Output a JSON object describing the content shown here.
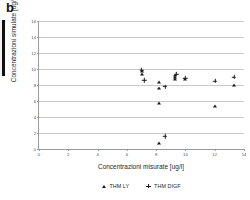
{
  "panel": {
    "label": "b"
  },
  "chart_data": {
    "type": "scatter",
    "title": "",
    "xlabel": "Concentrazioni misurate [ug/l]",
    "ylabel": "Concentrazioni simulate [ug/l]",
    "xlim": [
      0,
      14
    ],
    "ylim": [
      0,
      16
    ],
    "xticks": [
      0,
      2,
      4,
      6,
      8,
      10,
      12,
      14
    ],
    "yticks": [
      0,
      2,
      4,
      6,
      8,
      10,
      12,
      14,
      16
    ],
    "xtick_labels": [
      "0",
      "2",
      "4",
      "6",
      "8",
      "10",
      "12",
      "14"
    ],
    "ytick_labels": [
      "0",
      "2",
      "4",
      "6",
      "8",
      "10",
      "12",
      "14",
      "16"
    ],
    "grid": "horizontal",
    "legend_position": "bottom",
    "series": [
      {
        "name": "THM LY",
        "marker": "triangle",
        "color": "#1b1b1b",
        "points": [
          [
            7.0,
            9.8
          ],
          [
            7.0,
            9.4
          ],
          [
            8.2,
            8.4
          ],
          [
            8.2,
            7.6
          ],
          [
            8.2,
            5.8
          ],
          [
            8.2,
            0.8
          ],
          [
            9.3,
            9.2
          ],
          [
            9.3,
            9.0
          ],
          [
            9.3,
            8.8
          ],
          [
            10.0,
            8.8
          ],
          [
            12.0,
            5.4
          ],
          [
            13.3,
            8.0
          ]
        ]
      },
      {
        "name": "THM DIGF",
        "marker": "cross",
        "color": "#1b1b1b",
        "points": [
          [
            7.0,
            9.9
          ],
          [
            7.2,
            8.6
          ],
          [
            8.6,
            7.8
          ],
          [
            8.6,
            1.6
          ],
          [
            9.4,
            9.4
          ],
          [
            10.0,
            8.9
          ],
          [
            12.0,
            8.5
          ],
          [
            13.3,
            9.0
          ]
        ]
      }
    ]
  }
}
